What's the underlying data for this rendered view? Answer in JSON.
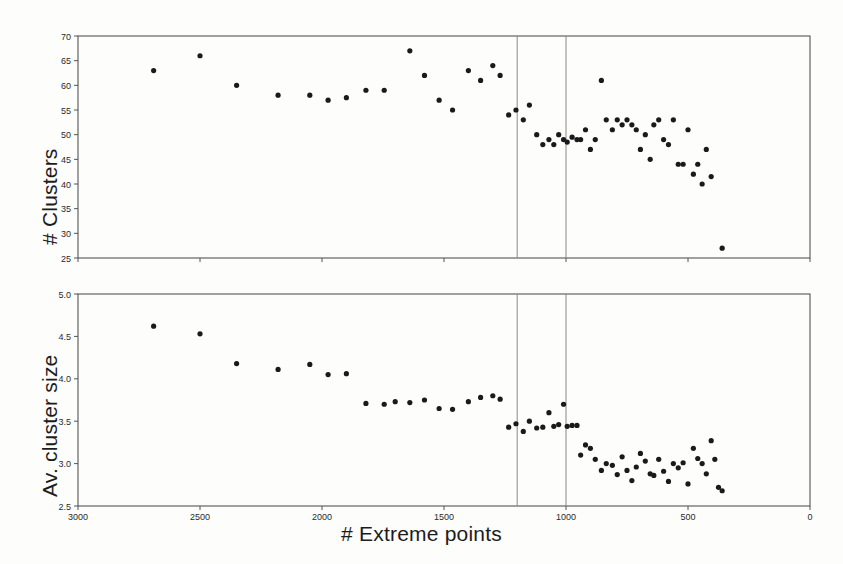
{
  "figure": {
    "background_color": "#fdfdfc",
    "axis_color": "#555555",
    "marker_color": "#1a1a1a",
    "vline_color": "#888888",
    "xlabel": "# Extreme points",
    "xticks": [
      3000,
      2500,
      2000,
      1500,
      1000,
      500,
      0
    ],
    "xlim": [
      3000,
      0
    ],
    "vlines": [
      1200,
      1000
    ]
  },
  "chart_data": [
    {
      "type": "scatter",
      "title": "",
      "xlabel": "# Extreme points",
      "ylabel": "# Clusters",
      "xlim": [
        3000,
        0
      ],
      "ylim": [
        25,
        70
      ],
      "yticks": [
        25,
        30,
        35,
        40,
        45,
        50,
        55,
        60,
        65,
        70
      ],
      "xticks": [
        3000,
        2500,
        2000,
        1500,
        1000,
        500,
        0
      ],
      "grid": false,
      "legend": "none",
      "annotations": [
        {
          "type": "vline",
          "x": 1200
        },
        {
          "type": "vline",
          "x": 1000
        }
      ],
      "points": [
        {
          "x": 2690,
          "y": 63
        },
        {
          "x": 2500,
          "y": 66
        },
        {
          "x": 2350,
          "y": 60
        },
        {
          "x": 2180,
          "y": 58
        },
        {
          "x": 2050,
          "y": 58
        },
        {
          "x": 1975,
          "y": 57
        },
        {
          "x": 1900,
          "y": 57.5
        },
        {
          "x": 1820,
          "y": 59
        },
        {
          "x": 1745,
          "y": 59
        },
        {
          "x": 1640,
          "y": 67
        },
        {
          "x": 1580,
          "y": 62
        },
        {
          "x": 1520,
          "y": 57
        },
        {
          "x": 1465,
          "y": 55
        },
        {
          "x": 1400,
          "y": 63
        },
        {
          "x": 1350,
          "y": 61
        },
        {
          "x": 1300,
          "y": 64
        },
        {
          "x": 1270,
          "y": 62
        },
        {
          "x": 1235,
          "y": 54
        },
        {
          "x": 1205,
          "y": 55
        },
        {
          "x": 1175,
          "y": 53
        },
        {
          "x": 1150,
          "y": 56
        },
        {
          "x": 1120,
          "y": 50
        },
        {
          "x": 1095,
          "y": 48
        },
        {
          "x": 1070,
          "y": 49
        },
        {
          "x": 1050,
          "y": 48
        },
        {
          "x": 1030,
          "y": 50
        },
        {
          "x": 1010,
          "y": 49
        },
        {
          "x": 995,
          "y": 48.5
        },
        {
          "x": 975,
          "y": 49.5
        },
        {
          "x": 955,
          "y": 49
        },
        {
          "x": 940,
          "y": 49
        },
        {
          "x": 920,
          "y": 51
        },
        {
          "x": 900,
          "y": 47
        },
        {
          "x": 880,
          "y": 49
        },
        {
          "x": 855,
          "y": 61
        },
        {
          "x": 835,
          "y": 53
        },
        {
          "x": 810,
          "y": 51
        },
        {
          "x": 790,
          "y": 53
        },
        {
          "x": 770,
          "y": 52
        },
        {
          "x": 750,
          "y": 53
        },
        {
          "x": 730,
          "y": 52
        },
        {
          "x": 712,
          "y": 51
        },
        {
          "x": 695,
          "y": 47
        },
        {
          "x": 675,
          "y": 50
        },
        {
          "x": 655,
          "y": 45
        },
        {
          "x": 640,
          "y": 52
        },
        {
          "x": 620,
          "y": 53
        },
        {
          "x": 600,
          "y": 49
        },
        {
          "x": 580,
          "y": 48
        },
        {
          "x": 560,
          "y": 53
        },
        {
          "x": 540,
          "y": 44
        },
        {
          "x": 520,
          "y": 44
        },
        {
          "x": 500,
          "y": 51
        },
        {
          "x": 478,
          "y": 42
        },
        {
          "x": 460,
          "y": 44
        },
        {
          "x": 442,
          "y": 40
        },
        {
          "x": 425,
          "y": 47
        },
        {
          "x": 405,
          "y": 41.5
        },
        {
          "x": 360,
          "y": 27
        }
      ]
    },
    {
      "type": "scatter",
      "title": "",
      "xlabel": "# Extreme points",
      "ylabel": "Av. cluster size",
      "xlim": [
        3000,
        0
      ],
      "ylim": [
        2.5,
        5.0
      ],
      "yticks": [
        2.5,
        3.0,
        3.5,
        4.0,
        4.5,
        5.0
      ],
      "xticks": [
        3000,
        2500,
        2000,
        1500,
        1000,
        500,
        0
      ],
      "grid": false,
      "legend": "none",
      "annotations": [
        {
          "type": "vline",
          "x": 1200
        },
        {
          "type": "vline",
          "x": 1000
        }
      ],
      "points": [
        {
          "x": 2690,
          "y": 4.62
        },
        {
          "x": 2500,
          "y": 4.53
        },
        {
          "x": 2350,
          "y": 4.18
        },
        {
          "x": 2180,
          "y": 4.11
        },
        {
          "x": 2050,
          "y": 4.17
        },
        {
          "x": 1975,
          "y": 4.05
        },
        {
          "x": 1900,
          "y": 4.06
        },
        {
          "x": 1820,
          "y": 3.71
        },
        {
          "x": 1745,
          "y": 3.7
        },
        {
          "x": 1700,
          "y": 3.73
        },
        {
          "x": 1640,
          "y": 3.72
        },
        {
          "x": 1580,
          "y": 3.75
        },
        {
          "x": 1520,
          "y": 3.65
        },
        {
          "x": 1465,
          "y": 3.64
        },
        {
          "x": 1400,
          "y": 3.73
        },
        {
          "x": 1350,
          "y": 3.78
        },
        {
          "x": 1300,
          "y": 3.8
        },
        {
          "x": 1270,
          "y": 3.76
        },
        {
          "x": 1235,
          "y": 3.43
        },
        {
          "x": 1205,
          "y": 3.47
        },
        {
          "x": 1175,
          "y": 3.38
        },
        {
          "x": 1150,
          "y": 3.5
        },
        {
          "x": 1120,
          "y": 3.42
        },
        {
          "x": 1095,
          "y": 3.43
        },
        {
          "x": 1070,
          "y": 3.6
        },
        {
          "x": 1050,
          "y": 3.44
        },
        {
          "x": 1030,
          "y": 3.46
        },
        {
          "x": 1010,
          "y": 3.7
        },
        {
          "x": 995,
          "y": 3.44
        },
        {
          "x": 975,
          "y": 3.45
        },
        {
          "x": 955,
          "y": 3.45
        },
        {
          "x": 940,
          "y": 3.1
        },
        {
          "x": 920,
          "y": 3.22
        },
        {
          "x": 900,
          "y": 3.18
        },
        {
          "x": 880,
          "y": 3.05
        },
        {
          "x": 855,
          "y": 2.92
        },
        {
          "x": 835,
          "y": 3.0
        },
        {
          "x": 810,
          "y": 2.98
        },
        {
          "x": 790,
          "y": 2.87
        },
        {
          "x": 770,
          "y": 3.08
        },
        {
          "x": 750,
          "y": 2.92
        },
        {
          "x": 730,
          "y": 2.8
        },
        {
          "x": 712,
          "y": 2.96
        },
        {
          "x": 695,
          "y": 3.12
        },
        {
          "x": 675,
          "y": 3.03
        },
        {
          "x": 655,
          "y": 2.88
        },
        {
          "x": 640,
          "y": 2.86
        },
        {
          "x": 620,
          "y": 3.05
        },
        {
          "x": 600,
          "y": 2.91
        },
        {
          "x": 580,
          "y": 2.79
        },
        {
          "x": 560,
          "y": 3.0
        },
        {
          "x": 540,
          "y": 2.95
        },
        {
          "x": 520,
          "y": 3.01
        },
        {
          "x": 500,
          "y": 2.76
        },
        {
          "x": 478,
          "y": 3.18
        },
        {
          "x": 460,
          "y": 3.06
        },
        {
          "x": 442,
          "y": 3.0
        },
        {
          "x": 425,
          "y": 2.88
        },
        {
          "x": 405,
          "y": 3.27
        },
        {
          "x": 390,
          "y": 3.05
        },
        {
          "x": 375,
          "y": 2.72
        },
        {
          "x": 360,
          "y": 2.68
        }
      ]
    }
  ]
}
